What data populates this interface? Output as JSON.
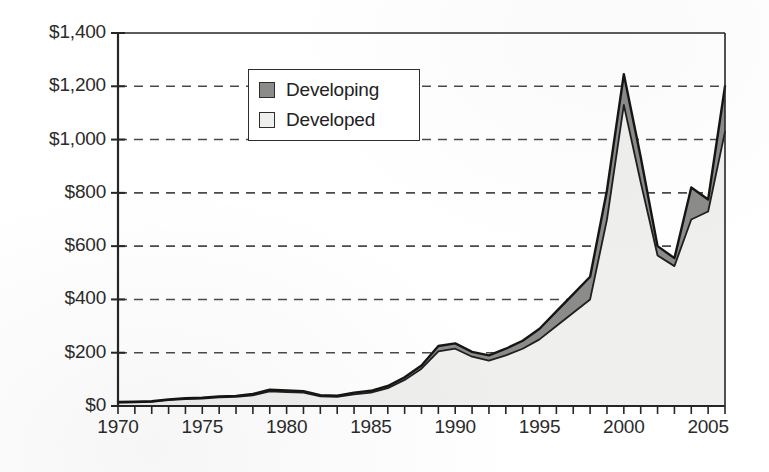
{
  "chart_data": {
    "type": "area",
    "title": "",
    "subtitle": "",
    "xlabel": "",
    "ylabel": "",
    "stacked": true,
    "grid": true,
    "grid_style": "dashed-horizontal",
    "legend_position": "inside-top-left",
    "xlim": [
      1970,
      2006
    ],
    "ylim": [
      0,
      1400
    ],
    "y_tick_step": 200,
    "x_tick_step": 1,
    "x_label_step": 5,
    "x_tick_labels": [
      "1970",
      "1975",
      "1980",
      "1985",
      "1990",
      "1995",
      "2000",
      "2005"
    ],
    "x_label_values": [
      1970,
      1975,
      1980,
      1985,
      1990,
      1995,
      2000,
      2005
    ],
    "y_tick_labels": [
      "$1,400",
      "$1,200",
      "$1,000",
      "$800",
      "$600",
      "$400",
      "$200",
      "$0"
    ],
    "y_tick_values": [
      1400,
      1200,
      1000,
      800,
      600,
      400,
      200,
      0
    ],
    "x": [
      1970,
      1971,
      1972,
      1973,
      1974,
      1975,
      1976,
      1977,
      1978,
      1979,
      1980,
      1981,
      1982,
      1983,
      1984,
      1985,
      1986,
      1987,
      1988,
      1989,
      1990,
      1991,
      1992,
      1993,
      1994,
      1995,
      1996,
      1997,
      1998,
      1999,
      2000,
      2001,
      2002,
      2003,
      2004,
      2005,
      2006
    ],
    "series": [
      {
        "name": "Developed",
        "color": "#efefed",
        "values": [
          13,
          14,
          16,
          22,
          26,
          28,
          32,
          34,
          40,
          55,
          52,
          50,
          36,
          34,
          44,
          50,
          67,
          98,
          140,
          205,
          215,
          185,
          170,
          190,
          215,
          250,
          300,
          350,
          400,
          700,
          1130,
          840,
          565,
          525,
          700,
          730,
          1030
        ]
      },
      {
        "name": "Developing",
        "color": "#8b8b89",
        "values": [
          2,
          2,
          2,
          3,
          3,
          3,
          4,
          4,
          5,
          6,
          6,
          6,
          5,
          5,
          6,
          7,
          8,
          10,
          12,
          20,
          20,
          18,
          20,
          25,
          30,
          40,
          55,
          70,
          85,
          110,
          115,
          95,
          35,
          30,
          120,
          45,
          170
        ]
      }
    ],
    "totals": [
      15,
      16,
      18,
      25,
      29,
      31,
      36,
      38,
      45,
      61,
      58,
      56,
      41,
      39,
      50,
      57,
      75,
      108,
      152,
      225,
      235,
      203,
      190,
      215,
      245,
      290,
      355,
      420,
      485,
      810,
      1245,
      935,
      600,
      555,
      820,
      775,
      1200
    ],
    "annotations": []
  },
  "legend": {
    "items": [
      {
        "label": "Developing",
        "swatch": "developing"
      },
      {
        "label": "Developed",
        "swatch": "developed"
      }
    ]
  },
  "caption": {
    "ghost_text": ""
  }
}
